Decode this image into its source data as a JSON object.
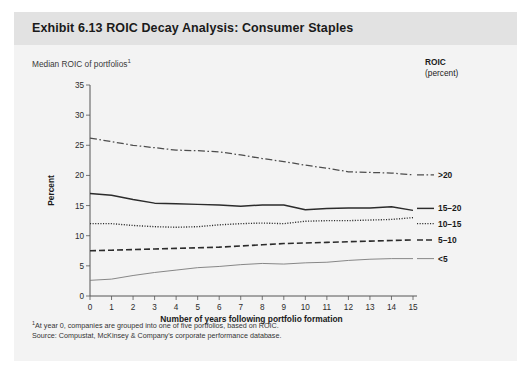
{
  "exhibit": {
    "title": "Exhibit 6.13 ROIC Decay Analysis: Consumer Staples",
    "subtitle": "Median ROIC of portfolios",
    "subtitle_footnote_marker": "1"
  },
  "legend": {
    "header_line1": "ROIC",
    "header_line2": "(percent)",
    "entries": [
      {
        "label": ">20",
        "style": "dash-dot",
        "color": "#4d4d4d"
      },
      {
        "label": "15–20",
        "style": "solid-thick",
        "color": "#2b2b2b"
      },
      {
        "label": "10–15",
        "style": "dotted",
        "color": "#2b2b2b"
      },
      {
        "label": "5–10",
        "style": "dashed",
        "color": "#2b2b2b"
      },
      {
        "label": "<5",
        "style": "solid-thin",
        "color": "#777777"
      }
    ]
  },
  "footnotes": {
    "marker": "1",
    "line1": "At year 0, companies are grouped into one of five portfolios, based on ROIC.",
    "line2": "Source: Compustat, McKinsey & Company's corporate performance database."
  },
  "chart_data": {
    "type": "line",
    "title": "Exhibit 6.13 ROIC Decay Analysis: Consumer Staples",
    "subtitle": "Median ROIC of portfolios",
    "xlabel": "Number of years following portfolio formation",
    "ylabel": "Percent",
    "xlim": [
      0,
      15
    ],
    "ylim": [
      0,
      35
    ],
    "ytick_step": 5,
    "grid": false,
    "legend_position": "right",
    "x": [
      0,
      1,
      2,
      3,
      4,
      5,
      6,
      7,
      8,
      9,
      10,
      11,
      12,
      13,
      14,
      15
    ],
    "xticks": [
      "0",
      "1",
      "2",
      "3",
      "4",
      "5",
      "6",
      "7",
      "8",
      "9",
      "10",
      "11",
      "12",
      "13",
      "14",
      "15"
    ],
    "yticks": [
      "0",
      "5",
      "10",
      "15",
      "20",
      "25",
      "30",
      "35"
    ],
    "series": [
      {
        "name": ">20",
        "style": "dash-dot",
        "values": [
          26.2,
          25.6,
          25.0,
          24.6,
          24.2,
          24.1,
          23.9,
          23.4,
          22.8,
          22.3,
          21.7,
          21.2,
          20.6,
          20.5,
          20.4,
          20.1
        ]
      },
      {
        "name": "15–20",
        "style": "solid-thick",
        "values": [
          17.0,
          16.7,
          16.0,
          15.4,
          15.3,
          15.2,
          15.1,
          14.9,
          15.1,
          15.1,
          14.3,
          14.5,
          14.6,
          14.6,
          14.8,
          14.2
        ]
      },
      {
        "name": "10–15",
        "style": "dotted",
        "values": [
          12.0,
          12.0,
          11.7,
          11.5,
          11.4,
          11.5,
          11.8,
          12.0,
          12.1,
          12.0,
          12.4,
          12.5,
          12.5,
          12.6,
          12.7,
          13.0
        ]
      },
      {
        "name": "5–10",
        "style": "dashed",
        "values": [
          7.5,
          7.6,
          7.7,
          7.8,
          7.9,
          8.0,
          8.1,
          8.3,
          8.5,
          8.7,
          8.8,
          8.9,
          9.0,
          9.1,
          9.2,
          9.3
        ]
      },
      {
        "name": "<5",
        "style": "solid-thin",
        "values": [
          2.6,
          2.8,
          3.4,
          3.9,
          4.3,
          4.7,
          4.9,
          5.2,
          5.4,
          5.3,
          5.5,
          5.6,
          5.9,
          6.1,
          6.2,
          6.2
        ]
      }
    ]
  }
}
